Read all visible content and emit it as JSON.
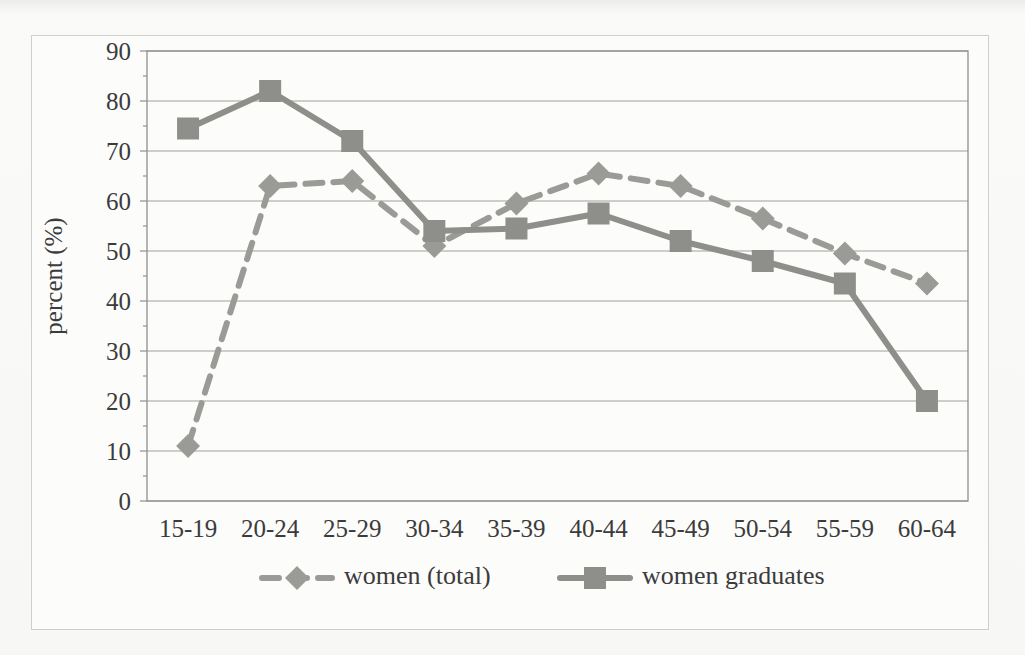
{
  "figure": {
    "top_cut_caption": "",
    "frame_border_color": "#cfcfcb",
    "background_color": "#fbfbfa"
  },
  "chart_data": {
    "type": "line",
    "title": "",
    "xlabel": "",
    "ylabel": "percent (%)",
    "categories": [
      "15-19",
      "20-24",
      "25-29",
      "30-34",
      "35-39",
      "40-44",
      "45-49",
      "50-54",
      "55-59",
      "60-64"
    ],
    "ylim": [
      0,
      90
    ],
    "ytick_step": 10,
    "yticks": [
      "90",
      "80",
      "70",
      "60",
      "50",
      "40",
      "30",
      "20",
      "10",
      "0"
    ],
    "grid": "horizontal",
    "legend_position": "bottom",
    "series": [
      {
        "name": "women (total)",
        "marker": "diamond",
        "style": "dashed",
        "color": "#9a9a97",
        "values": [
          11,
          63,
          64,
          51,
          59.5,
          65.5,
          63,
          56.5,
          49.5,
          43.5
        ]
      },
      {
        "name": "women graduates",
        "marker": "square",
        "style": "solid",
        "color": "#8e8e8b",
        "values": [
          74.5,
          82,
          72,
          54,
          54.5,
          57.5,
          52,
          48,
          43.5,
          20
        ]
      }
    ]
  }
}
